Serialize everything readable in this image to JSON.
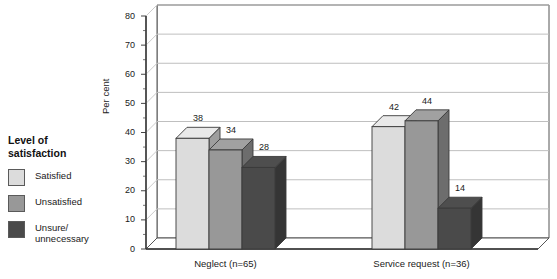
{
  "legend": {
    "title": "Level of\nsatisfaction",
    "items": [
      {
        "label": "Satisfied",
        "color": "#dcdcdc"
      },
      {
        "label": "Unsatisfied",
        "color": "#989898"
      },
      {
        "label": "Unsure/\nunnecessary",
        "color": "#4a4a4a"
      }
    ]
  },
  "chart_data": {
    "type": "bar",
    "title": "",
    "subtitle": "",
    "xlabel": "",
    "ylabel": "Per cent",
    "ylim": [
      0,
      80
    ],
    "ytick_step": 10,
    "yminor_step": 5,
    "yticks": [
      "0",
      "10",
      "20",
      "30",
      "40",
      "50",
      "60",
      "70",
      "80"
    ],
    "grid": true,
    "grid_axis": "y",
    "three_d": true,
    "legend_position": "left",
    "categories": [
      "Neglect (n=65)",
      "Service request (n=36)"
    ],
    "series": [
      {
        "name": "Satisfied",
        "color": "#dcdcdc",
        "values": [
          38,
          42
        ]
      },
      {
        "name": "Unsatisfied",
        "color": "#989898",
        "values": [
          34,
          44
        ]
      },
      {
        "name": "Unsure/unnecessary",
        "color": "#4a4a4a",
        "values": [
          28,
          14
        ]
      }
    ],
    "data_labels": [
      [
        "38",
        "34",
        "28"
      ],
      [
        "42",
        "44",
        "14"
      ]
    ]
  }
}
